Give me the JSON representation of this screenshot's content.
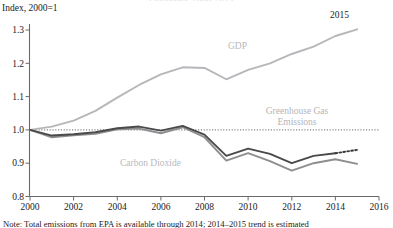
{
  "chart_data": {
    "type": "line",
    "title": "Emissions, 2000-2015",
    "subtitle": "",
    "ylabel": "Index, 2000=1",
    "xlabel": "",
    "ylim": [
      0.8,
      1.3
    ],
    "xlim": [
      2000,
      2016
    ],
    "grid": false,
    "legend_position": "inline-annotations",
    "yticks": [
      "0.8",
      "0.9",
      "1.0",
      "1.1",
      "1.2",
      "1.3"
    ],
    "ytick_values": [
      0.8,
      0.9,
      1.0,
      1.1,
      1.2,
      1.3
    ],
    "xticks": [
      "2000",
      "2002",
      "2004",
      "2006",
      "2008",
      "2010",
      "2012",
      "2014",
      "2016"
    ],
    "xtick_values": [
      2000,
      2002,
      2004,
      2006,
      2008,
      2010,
      2012,
      2014,
      2016
    ],
    "x": [
      2000,
      2001,
      2002,
      2003,
      2004,
      2005,
      2006,
      2007,
      2008,
      2009,
      2010,
      2011,
      2012,
      2013,
      2014,
      2015
    ],
    "reference_line": {
      "y": 1.0,
      "style": "dotted",
      "color": "#6a6a6a"
    },
    "series": [
      {
        "name": "GDP",
        "color": "#b7b7bb",
        "style": "solid",
        "label_x": 2008.1,
        "label_y": 1.222,
        "values": [
          1.0,
          1.01,
          1.028,
          1.057,
          1.097,
          1.135,
          1.167,
          1.188,
          1.186,
          1.152,
          1.18,
          1.2,
          1.228,
          1.25,
          1.282,
          1.302
        ]
      },
      {
        "name": "Greenhouse Gas Emissions",
        "color": "#4a4a4a",
        "style": "solid-with-dashed-tail",
        "dashed_from": 2014,
        "label_x": 2011.9,
        "label_y": 1.047,
        "values": [
          1.0,
          0.983,
          0.987,
          0.993,
          1.005,
          1.01,
          0.998,
          1.012,
          0.986,
          0.922,
          0.944,
          0.928,
          0.9,
          0.922,
          0.93,
          0.94
        ]
      },
      {
        "name": "Carbon Dioxide",
        "color": "#8e8e92",
        "style": "solid",
        "label_x": 2004.6,
        "label_y": 0.928,
        "values": [
          1.0,
          0.978,
          0.984,
          0.988,
          1.002,
          1.004,
          0.99,
          1.008,
          0.978,
          0.908,
          0.93,
          0.906,
          0.878,
          0.9,
          0.912,
          0.898
        ]
      }
    ],
    "annotations": [
      {
        "text": "2015",
        "x": 2014.3,
        "y": 1.318,
        "target": "GDP endpoint"
      }
    ],
    "note": "Note: Total emissions from EPA is available through 2014; 2014_2015 trend is estimated"
  }
}
